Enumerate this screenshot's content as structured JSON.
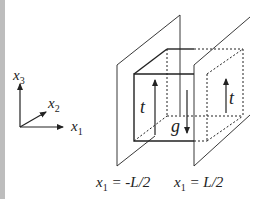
{
  "diagram": {
    "axes": {
      "x1": {
        "base": "x",
        "sub": "1"
      },
      "x2": {
        "base": "x",
        "sub": "2"
      },
      "x3": {
        "base": "x",
        "sub": "3"
      }
    },
    "labels": {
      "traction_left": "t",
      "traction_right": "t",
      "gravity": "g"
    },
    "planes": {
      "left": {
        "base": "x",
        "sub": "1",
        "eq": " = -L/2"
      },
      "right": {
        "base": "x",
        "sub": "1",
        "eq": " = L/2"
      }
    },
    "colors": {
      "line": "#222222",
      "background": "#ffffff",
      "left_strip": "#bdbdbd"
    }
  }
}
